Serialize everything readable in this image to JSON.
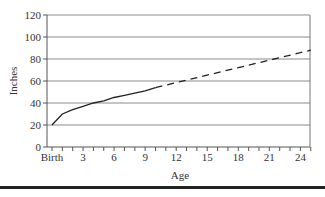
{
  "chart_data": {
    "type": "line",
    "title": "",
    "xlabel": "Age",
    "ylabel": "Inches",
    "xlim": [
      0,
      25
    ],
    "ylim": [
      0,
      120
    ],
    "grid": true,
    "legend": null,
    "x_tick_labels": [
      "Birth",
      "3",
      "6",
      "9",
      "12",
      "15",
      "18",
      "21",
      "24"
    ],
    "x_tick_values": [
      0,
      3,
      6,
      9,
      12,
      15,
      18,
      21,
      24
    ],
    "y_tick_labels": [
      "0",
      "20",
      "40",
      "60",
      "80",
      "100",
      "120"
    ],
    "y_tick_values": [
      0,
      20,
      40,
      60,
      80,
      100,
      120
    ],
    "series": [
      {
        "name": "Measured height",
        "style": "solid",
        "x": [
          0,
          1,
          2,
          3,
          4,
          5,
          6,
          7,
          8,
          9,
          10
        ],
        "y": [
          20,
          30,
          34,
          37,
          40,
          42,
          45,
          47,
          49,
          51,
          54
        ]
      },
      {
        "name": "Projected height",
        "style": "dashed",
        "x": [
          10,
          25
        ],
        "y": [
          54,
          88
        ]
      }
    ]
  }
}
